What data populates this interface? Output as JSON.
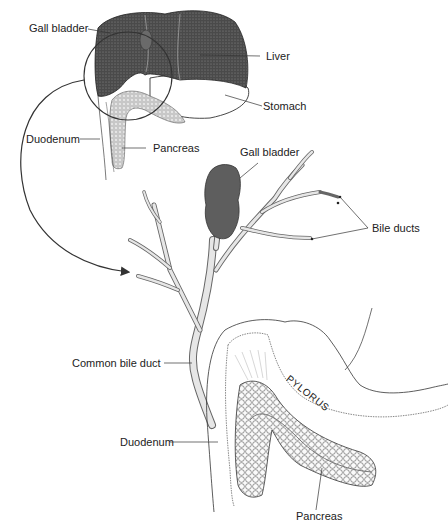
{
  "diagram": {
    "type": "anatomical-illustration",
    "colors": {
      "ink": "#222222",
      "liver_fill": "#4a4a4a",
      "gallbladder_fill": "#5e5e5e",
      "pancreas_fill": "#d8d8d8",
      "duct_fill": "#e6e6e6",
      "background": "#ffffff"
    },
    "overview_inset": {
      "labels": {
        "gall_bladder": "Gall bladder",
        "liver": "Liver",
        "stomach": "Stomach",
        "duodenum": "Duodenum",
        "pancreas": "Pancreas"
      }
    },
    "detail_view": {
      "labels": {
        "gall_bladder": "Gall bladder",
        "bile_ducts": "Bile ducts",
        "common_bile_duct": "Common bile duct",
        "duodenum": "Duodenum",
        "pylorus": "PYLORUS",
        "pancreas": "Pancreas"
      }
    },
    "connector": "magnify-arrow"
  }
}
